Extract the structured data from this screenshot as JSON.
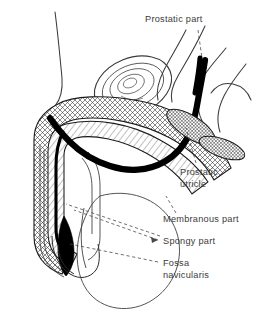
{
  "figure": {
    "background_color": "#ffffff",
    "ink_color": "#1a1a1a",
    "label_color": "#3b3b3b",
    "urethra_color": "#000000"
  },
  "labels": [
    {
      "id": "prostatic-part",
      "text": "Prostatic part",
      "x": 145,
      "y": 22
    },
    {
      "id": "prostatic-utricle-1",
      "text": "Prostatic",
      "x": 180,
      "y": 175
    },
    {
      "id": "prostatic-utricle-2",
      "text": "utricle",
      "x": 180,
      "y": 187
    },
    {
      "id": "membranous-part",
      "text": "Membranous part",
      "x": 163,
      "y": 222
    },
    {
      "id": "spongy-part",
      "text": "Spongy  part",
      "x": 163,
      "y": 244
    },
    {
      "id": "fossa-1",
      "text": "Fossa",
      "x": 163,
      "y": 266
    },
    {
      "id": "fossa-2",
      "text": "navicularis",
      "x": 163,
      "y": 278
    }
  ],
  "structures": [
    {
      "id": "corpus-spongiosum",
      "pattern": "cross-hatch"
    },
    {
      "id": "corpus-cavernosum",
      "pattern": "diagonal-hatch"
    },
    {
      "id": "urethral-lumen",
      "pattern": "solid-black"
    },
    {
      "id": "bladder",
      "pattern": "concentric-rings"
    },
    {
      "id": "crus-penis",
      "pattern": "cross-hatch"
    },
    {
      "id": "bulb-of-penis",
      "pattern": "cross-hatch"
    },
    {
      "id": "scrotum",
      "pattern": "outline"
    },
    {
      "id": "glans-penis",
      "pattern": "outline"
    }
  ],
  "leaders": [
    {
      "id": "leader-prostatic-part",
      "style": "dashed"
    },
    {
      "id": "leader-prostatic-utricle",
      "style": "dashed"
    },
    {
      "id": "leader-membranous-part",
      "style": "dashed"
    },
    {
      "id": "leader-spongy-part",
      "style": "dashed-arrow"
    },
    {
      "id": "leader-fossa-navicularis",
      "style": "dashed"
    }
  ]
}
